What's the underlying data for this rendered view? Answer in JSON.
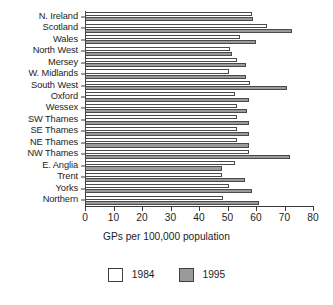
{
  "chart_data": {
    "type": "bar",
    "orientation": "horizontal",
    "title": "",
    "xlabel": "GPs per 100,000 population",
    "ylabel": "",
    "xlim": [
      0,
      80
    ],
    "xticks": [
      0,
      10,
      20,
      30,
      40,
      50,
      60,
      70,
      80
    ],
    "grid": false,
    "legend_position": "bottom-center",
    "categories": [
      "N. Ireland",
      "Scotland",
      "Wales",
      "North West",
      "Mersey",
      "W. Midlands",
      "South West",
      "Oxford",
      "Wessex",
      "SW Thames",
      "SE Thames",
      "NE Thames",
      "NW Thames",
      "E. Anglia",
      "Trent",
      "Yorks",
      "Northern"
    ],
    "series": [
      {
        "name": "1984",
        "color": "#ffffff",
        "values": [
          58.5,
          64.0,
          54.5,
          51.0,
          53.5,
          50.5,
          58.0,
          52.5,
          53.5,
          53.5,
          53.5,
          53.5,
          57.5,
          52.5,
          48.0,
          50.5,
          48.5
        ]
      },
      {
        "name": "1995",
        "color": "#9a9a9a",
        "values": [
          59.0,
          72.5,
          60.0,
          51.5,
          56.5,
          56.5,
          71.0,
          57.5,
          57.0,
          57.5,
          57.5,
          57.5,
          72.0,
          48.0,
          56.0,
          58.5,
          61.0
        ]
      }
    ]
  },
  "legend": {
    "items": [
      {
        "label": "1984",
        "swatch": "white-square"
      },
      {
        "label": "1995",
        "swatch": "gray-square"
      }
    ]
  },
  "axis": {
    "x_title": "GPs per 100,000 population",
    "x_tick_labels": [
      "0",
      "10",
      "20",
      "30",
      "40",
      "50",
      "60",
      "70",
      "80"
    ]
  }
}
